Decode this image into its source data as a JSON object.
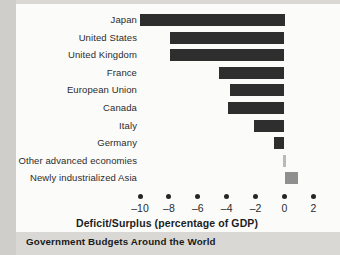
{
  "figure": {
    "caption": "Government Budgets Around the World"
  },
  "chart_data": {
    "type": "bar",
    "orientation": "horizontal",
    "title": "Government Budgets Around the World",
    "xlabel": "Deficit/Surplus (percentage of GDP)",
    "ylabel": "",
    "xlim": [
      -11,
      2.6
    ],
    "grid": false,
    "legend": null,
    "xticks": [
      -10,
      -8,
      -6,
      -4,
      -2,
      0,
      2
    ],
    "xticklabels": [
      "–10",
      "–8",
      "–6",
      "–4",
      "–2",
      "0",
      "2"
    ],
    "categories": [
      "Japan",
      "United States",
      "United Kingdom",
      "France",
      "European Union",
      "Canada",
      "Italy",
      "Germany",
      "Other advanced economies",
      "Newly industrialized Asia"
    ],
    "values": [
      -10.0,
      -7.9,
      -7.9,
      -4.5,
      -3.8,
      -3.9,
      -2.1,
      -0.7,
      -0.1,
      0.9
    ],
    "bar_colors": [
      "#2e2e2e",
      "#2e2e2e",
      "#2e2e2e",
      "#2e2e2e",
      "#2e2e2e",
      "#2e2e2e",
      "#2e2e2e",
      "#2e2e2e",
      "#b9b9b9",
      "#8f8f8f"
    ],
    "colors": {
      "deficit_bar": "#2e2e2e",
      "surplus_bar": "#8f8f8f",
      "text": "#2b2b2b",
      "plot_background": "#fbfbfa",
      "page_background": "#d9d8d4"
    }
  }
}
